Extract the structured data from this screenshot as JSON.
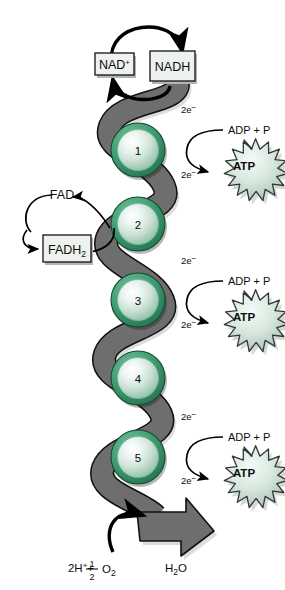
{
  "figure": {
    "background": "#ffffff"
  },
  "colors": {
    "ribbon_fill": "#6e6e6e",
    "ribbon_stroke": "#111111",
    "sphere_ring_dark": "#2e8b62",
    "sphere_ring_mid": "#4aa97f",
    "sphere_core_light": "#f2f8f5",
    "sphere_core_mid": "#cfe3d8",
    "sphere_core_edge": "#8fc0a8",
    "box_fill": "#eef2ef",
    "box_stroke": "#111111",
    "atp_fill_center": "#eef4f0",
    "atp_fill_edge": "#aec6ba",
    "atp_stroke": "#2f3a35",
    "arrow_black": "#000000",
    "text": "#0d0d0d",
    "shadow": "#b4b4b4"
  },
  "carriers": {
    "nad_oxidized": {
      "label": "NAD",
      "charge": "+",
      "boxed": true
    },
    "nad_reduced": {
      "label": "NADH",
      "boxed": true
    },
    "fad_oxidized": {
      "label": "FAD",
      "boxed": false
    },
    "fad_reduced": {
      "label": "FADH",
      "subscript": "2",
      "boxed": true
    }
  },
  "complexes": [
    {
      "number": "1"
    },
    {
      "number": "2"
    },
    {
      "number": "3"
    },
    {
      "number": "4"
    },
    {
      "number": "5"
    }
  ],
  "electron_labels": [
    {
      "text": "2e",
      "superscript": "−"
    },
    {
      "text": "2e",
      "superscript": "−"
    },
    {
      "text": "2e",
      "superscript": "−"
    },
    {
      "text": "2e",
      "superscript": "−"
    },
    {
      "text": "2e",
      "superscript": "−"
    },
    {
      "text": "2e",
      "superscript": "−"
    }
  ],
  "atp_sites": [
    {
      "substrate": "ADP + P",
      "product": "ATP"
    },
    {
      "substrate": "ADP + P",
      "product": "ATP"
    },
    {
      "substrate": "ADP + P",
      "product": "ATP"
    }
  ],
  "terminal_reaction": {
    "reactant_prefix": "2H",
    "reactant_charge": "+",
    "plus": "+",
    "fraction_numerator": "1",
    "fraction_denominator": "2",
    "oxygen": "O",
    "oxygen_subscript": "2",
    "product_prefix": "H",
    "product_subscript": "2",
    "product_suffix": "O"
  }
}
